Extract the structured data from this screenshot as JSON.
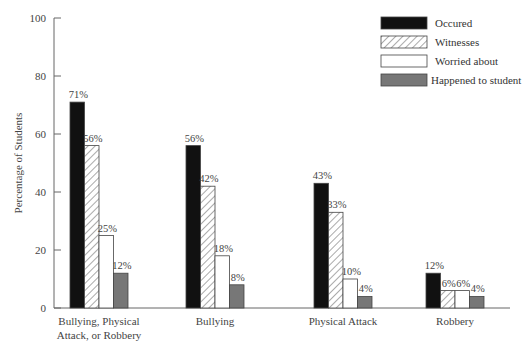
{
  "chart_data": {
    "type": "bar",
    "title": "",
    "xlabel": "",
    "ylabel": "Percentage of Students",
    "ylim": [
      0,
      100
    ],
    "yticks": [
      0,
      20,
      40,
      60,
      80,
      100
    ],
    "grid": false,
    "legend_position": "top-right",
    "categories": [
      [
        "Bullying, Physical",
        "Attack, or Robbery"
      ],
      [
        "Bullying"
      ],
      [
        "Physical Attack"
      ],
      [
        "Robbery"
      ]
    ],
    "series": [
      {
        "name": "Occured",
        "style": "solid-black",
        "color": "#111111",
        "values": [
          71,
          56,
          43,
          12
        ]
      },
      {
        "name": "Witnesses",
        "style": "hatched",
        "color": "#ffffff",
        "values": [
          56,
          42,
          33,
          6
        ]
      },
      {
        "name": "Worried about",
        "style": "white",
        "color": "#ffffff",
        "values": [
          25,
          18,
          10,
          6
        ]
      },
      {
        "name": "Happened to student",
        "style": "solid-gray",
        "color": "#777777",
        "values": [
          12,
          8,
          4,
          4
        ]
      }
    ],
    "value_labels": [
      [
        "71%",
        "56%",
        "25%",
        "12%"
      ],
      [
        "56%",
        "42%",
        "18%",
        "8%"
      ],
      [
        "43%",
        "33%",
        "10%",
        "4%"
      ],
      [
        "12%",
        "6%",
        "6%",
        "4%"
      ]
    ]
  }
}
